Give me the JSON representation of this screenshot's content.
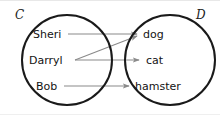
{
  "diagram": {
    "type": "mapping-diagram",
    "background_color": "#ffffff",
    "circle_stroke_color": "#1a1a1a",
    "arrow_color": "#8a8a8a",
    "text_color": "#131313",
    "sets": [
      {
        "id": "C",
        "label": "C",
        "role": "domain",
        "center_x": 67,
        "center_y": 59,
        "radius": 45,
        "label_x": 15,
        "label_y": 8
      },
      {
        "id": "D",
        "label": "D",
        "role": "codomain",
        "center_x": 170,
        "center_y": 59,
        "radius": 45,
        "label_x": 196,
        "label_y": 8
      }
    ],
    "left_elements": [
      {
        "label": "Sheri",
        "x": 33,
        "y": 33,
        "line_start_x": 68
      },
      {
        "label": "Darryl",
        "x": 29,
        "y": 59,
        "line_start_x": 75
      },
      {
        "label": "Bob",
        "x": 36,
        "y": 85,
        "line_start_x": 64
      }
    ],
    "right_elements": [
      {
        "label": "dog",
        "x": 143,
        "y": 33,
        "arrow_tip_x": 137
      },
      {
        "label": "cat",
        "x": 146,
        "y": 59,
        "arrow_tip_x": 139
      },
      {
        "label": "hamster",
        "x": 135,
        "y": 85,
        "arrow_tip_x": 129
      }
    ],
    "arrows": [
      {
        "from": "Sheri",
        "to": "dog",
        "x1": 68,
        "y1": 33,
        "x2": 137,
        "y2": 33
      },
      {
        "from": "Darryl",
        "to": "dog",
        "x1": 75,
        "y1": 59,
        "x2": 137,
        "y2": 35
      },
      {
        "from": "Darryl",
        "to": "cat",
        "x1": 75,
        "y1": 59,
        "x2": 139,
        "y2": 59
      },
      {
        "from": "Bob",
        "to": "hamster",
        "x1": 64,
        "y1": 85,
        "x2": 129,
        "y2": 85
      }
    ]
  }
}
